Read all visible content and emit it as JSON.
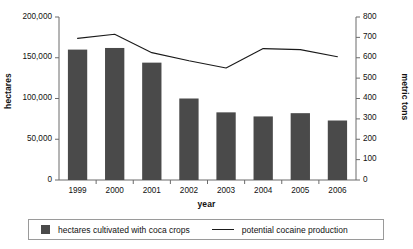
{
  "chart_data": {
    "type": "bar",
    "title": "",
    "subtitle": "",
    "xlabel": "year",
    "ylabel": "hectares",
    "ylabel_secondary": "metric tons",
    "categories": [
      "1999",
      "2000",
      "2001",
      "2002",
      "2003",
      "2004",
      "2005",
      "2006"
    ],
    "grid": false,
    "legend_position": "bottom",
    "ylim": [
      0,
      200000
    ],
    "ylim_secondary": [
      0,
      800
    ],
    "y_ticks": [
      0,
      50000,
      100000,
      150000,
      200000
    ],
    "y_tick_labels": [
      "0",
      "50,000",
      "100,000",
      "150,000",
      "200,000"
    ],
    "y_ticks_secondary": [
      0,
      100,
      200,
      300,
      400,
      500,
      600,
      700,
      800
    ],
    "y_tick_labels_secondary": [
      "0",
      "100",
      "200",
      "300",
      "400",
      "500",
      "600",
      "700",
      "800"
    ],
    "series": [
      {
        "name": "hectares cultivated with coca crops",
        "type": "bar",
        "axis": "left",
        "color": "#4a4a4a",
        "values": [
          160000,
          162000,
          144000,
          100000,
          83000,
          78000,
          82000,
          73000
        ]
      },
      {
        "name": "potential cocaine production",
        "type": "line",
        "axis": "right",
        "color": "#1a1a1a",
        "values": [
          695,
          715,
          625,
          585,
          550,
          645,
          640,
          605
        ]
      }
    ]
  },
  "legend": {
    "bars_label": "hectares cultivated with coca crops",
    "line_label": "potential cocaine production"
  },
  "colors": {
    "bar_fill": "#4a4a4a",
    "line_stroke": "#1a1a1a",
    "axis": "#6b6b6b",
    "text": "#111111"
  }
}
